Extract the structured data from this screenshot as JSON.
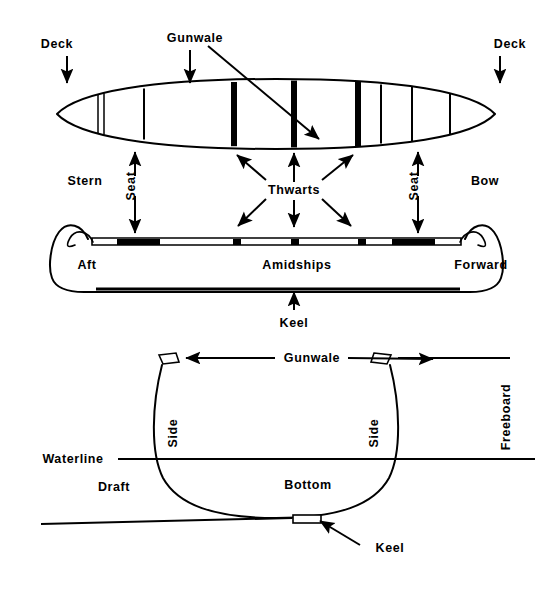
{
  "diagram": {
    "colors": {
      "ink": "#000000",
      "paper": "#ffffff"
    },
    "views": [
      {
        "id": "plan",
        "name": "Top / Plan View"
      },
      {
        "id": "profile",
        "name": "Side / Profile View"
      },
      {
        "id": "section",
        "name": "Cross Section View"
      }
    ]
  },
  "plan_view": {
    "labels": {
      "deck_left": "Deck",
      "deck_right": "Deck",
      "gunwale": "Gunwale",
      "stern": "Stern",
      "bow": "Bow",
      "seat_left": "Seat",
      "seat_right": "Seat",
      "thwarts": "Thwarts"
    }
  },
  "profile_view": {
    "labels": {
      "aft": "Aft",
      "amidships": "Amidships",
      "forward": "Forward",
      "keel": "Keel"
    }
  },
  "section_view": {
    "labels": {
      "gunwale": "Gunwale",
      "side_left": "Side",
      "side_right": "Side",
      "freeboard": "Freeboard",
      "waterline": "Waterline",
      "draft": "Draft",
      "bottom": "Bottom",
      "keel": "Keel"
    }
  },
  "icons": {
    "arrow_down": "arrow-down-icon",
    "arrow_up": "arrow-up-icon",
    "arrow_left": "arrow-left-icon",
    "arrow_right": "arrow-right-icon",
    "arrow_diagonal": "arrow-diagonal-icon"
  }
}
